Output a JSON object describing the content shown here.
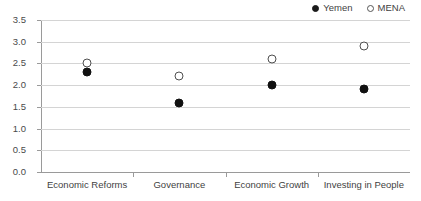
{
  "chart_data": {
    "type": "scatter",
    "title": "",
    "xlabel": "",
    "ylabel": "",
    "categories": [
      "Economic Reforms",
      "Governance",
      "Economic Growth",
      "Investing in People"
    ],
    "series": [
      {
        "name": "Yemen",
        "marker": "filled-circle",
        "color": "#111111",
        "values": [
          2.3,
          1.6,
          2.0,
          1.9
        ]
      },
      {
        "name": "MENA",
        "marker": "open-circle",
        "color": "#4f4f4f",
        "values": [
          2.5,
          2.2,
          2.6,
          2.9
        ]
      }
    ],
    "ylim": [
      0.0,
      3.5
    ],
    "ytick_step": 0.5,
    "ytick_labels": [
      "0.0",
      "0.5",
      "1.0",
      "1.5",
      "2.0",
      "2.5",
      "3.0",
      "3.5"
    ],
    "grid": true,
    "legend_position": "top-right"
  },
  "legend": {
    "entries": [
      {
        "label": "Yemen",
        "marker": "filled-circle"
      },
      {
        "label": "MENA",
        "marker": "open-circle"
      }
    ]
  },
  "colors": {
    "yemen": "#111111",
    "mena": "#4f4f4f",
    "gridline": "#d4d4d4",
    "axis": "#9a9a9a",
    "text": "#3f3f3f",
    "background": "#ffffff"
  }
}
